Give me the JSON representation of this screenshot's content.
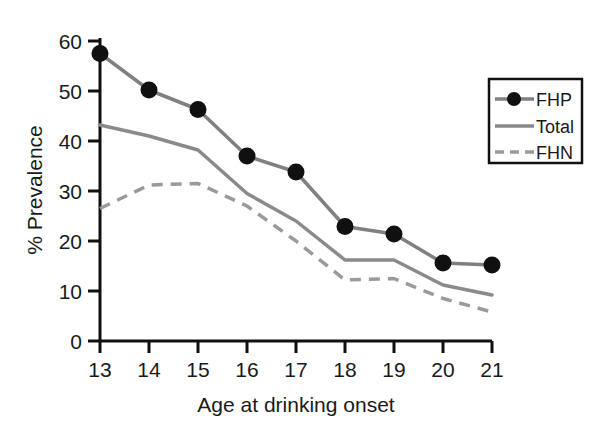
{
  "chart_data": {
    "type": "line",
    "title": "",
    "xlabel": "Age at drinking onset",
    "ylabel": "% Prevalence",
    "categories": [
      "13",
      "14",
      "15",
      "16",
      "17",
      "18",
      "19",
      "20",
      "21"
    ],
    "x": [
      13,
      14,
      15,
      16,
      17,
      18,
      19,
      20,
      21
    ],
    "xlim": [
      13,
      21
    ],
    "ylim": [
      0,
      60
    ],
    "yticks": [
      "0",
      "10",
      "20",
      "30",
      "40",
      "50",
      "60"
    ],
    "ytick_values": [
      0,
      10,
      20,
      30,
      40,
      50,
      60
    ],
    "xticks": [
      "13",
      "14",
      "15",
      "16",
      "17",
      "18",
      "19",
      "20",
      "21"
    ],
    "grid": false,
    "legend_position": "upper right",
    "series": [
      {
        "name": "FHP",
        "style": "solid-with-markers",
        "color": "#808080",
        "marker_color": "#101010",
        "values": [
          57.5,
          50.2,
          46.3,
          37.0,
          33.8,
          22.9,
          21.4,
          15.6,
          15.2
        ]
      },
      {
        "name": "Total",
        "style": "solid",
        "color": "#8a8a8a",
        "values": [
          43.2,
          41.0,
          38.2,
          29.5,
          24.0,
          16.2,
          16.2,
          11.2,
          9.2
        ]
      },
      {
        "name": "FHN",
        "style": "dashed",
        "color": "#9a9a9a",
        "values": [
          26.5,
          31.2,
          31.5,
          27.0,
          20.0,
          12.2,
          12.5,
          8.5,
          5.8
        ]
      }
    ]
  },
  "legend": {
    "items": [
      {
        "label": "FHP"
      },
      {
        "label": "Total"
      },
      {
        "label": "FHN"
      }
    ]
  },
  "axes": {
    "y_title": "% Prevalence",
    "x_title": "Age at drinking onset"
  },
  "caption": {
    "text": ""
  },
  "colors": {
    "axis": "#101010",
    "fhp_line": "#808080",
    "fhp_marker": "#101010",
    "total_line": "#8a8a8a",
    "fhn_line": "#9a9a9a",
    "background": "#ffffff"
  }
}
